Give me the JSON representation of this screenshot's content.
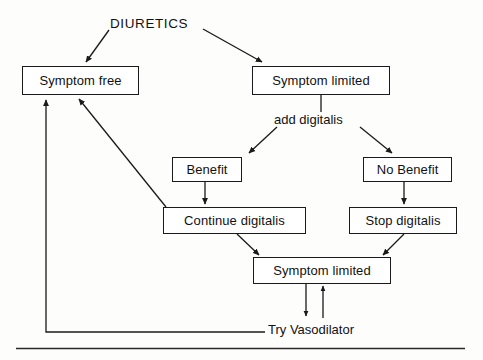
{
  "diagram": {
    "type": "flowchart",
    "labels": {
      "diuretics": "DIURETICS",
      "add_digitalis": "add digitalis",
      "try_vasodilator": "Try Vasodilator"
    },
    "nodes": [
      {
        "id": "symptom-free",
        "label": "Symptom free"
      },
      {
        "id": "symptom-limited-1",
        "label": "Symptom limited"
      },
      {
        "id": "benefit",
        "label": "Benefit"
      },
      {
        "id": "no-benefit",
        "label": "No Benefit"
      },
      {
        "id": "continue-digitalis",
        "label": "Continue digitalis"
      },
      {
        "id": "stop-digitalis",
        "label": "Stop digitalis"
      },
      {
        "id": "symptom-limited-2",
        "label": "Symptom limited"
      }
    ],
    "edges": [
      {
        "from": "diuretics",
        "to": "symptom-free",
        "style": "arrow-diagonal"
      },
      {
        "from": "diuretics",
        "to": "symptom-limited-1",
        "style": "arrow-diagonal"
      },
      {
        "from": "symptom-limited-1",
        "to": "add-digitalis",
        "style": "line-vertical"
      },
      {
        "from": "add-digitalis",
        "to": "benefit",
        "style": "arrow-diagonal"
      },
      {
        "from": "add-digitalis",
        "to": "no-benefit",
        "style": "arrow-diagonal"
      },
      {
        "from": "benefit",
        "to": "continue-digitalis",
        "style": "arrow-vertical"
      },
      {
        "from": "no-benefit",
        "to": "stop-digitalis",
        "style": "arrow-vertical"
      },
      {
        "from": "continue-digitalis",
        "to": "symptom-free",
        "style": "arrow-diagonal"
      },
      {
        "from": "continue-digitalis",
        "to": "symptom-limited-2",
        "style": "arrow-diagonal"
      },
      {
        "from": "stop-digitalis",
        "to": "symptom-limited-2",
        "style": "arrow-diagonal"
      },
      {
        "from": "symptom-limited-2",
        "to": "try-vasodilator",
        "style": "arrow-down"
      },
      {
        "from": "try-vasodilator",
        "to": "symptom-limited-2",
        "style": "arrow-up"
      },
      {
        "from": "try-vasodilator",
        "to": "symptom-free",
        "style": "arrow-elbow-left"
      }
    ],
    "colors": {
      "stroke": "#1a1a1a",
      "text": "#111111",
      "background": "#fdfdfc",
      "box_fill": "#ffffff"
    }
  }
}
